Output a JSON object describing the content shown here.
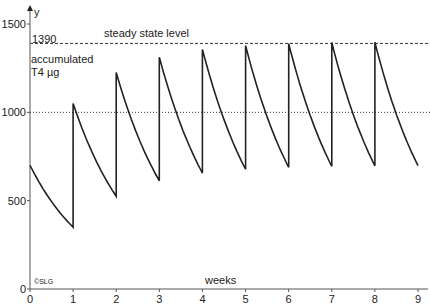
{
  "chart_data": {
    "type": "line",
    "title": "",
    "xlabel": "weeks",
    "ylabel": "y",
    "annotation_ylabel": [
      "accumulated",
      "T4 µg"
    ],
    "xlim": [
      0,
      9
    ],
    "ylim": [
      0,
      1500
    ],
    "x_ticks": [
      "0",
      "1",
      "2",
      "3",
      "4",
      "5",
      "6",
      "7",
      "8",
      "9"
    ],
    "y_ticks": [
      "0",
      "500",
      "1000",
      "1500"
    ],
    "reference_lines": [
      {
        "y": 1390,
        "label": "1390",
        "text": "steady state level",
        "style": "dashed"
      },
      {
        "y": 1000,
        "label": "",
        "text": "",
        "style": "dotted"
      }
    ],
    "copyright": "©SLG",
    "series": [
      {
        "name": "accumulated T4",
        "dose": 700,
        "weekly_decay_factor": 0.5,
        "points": [
          [
            0,
            700
          ],
          [
            1,
            350
          ],
          [
            1,
            1050
          ],
          [
            2,
            525
          ],
          [
            2,
            1225
          ],
          [
            3,
            612
          ],
          [
            3,
            1312
          ],
          [
            4,
            656
          ],
          [
            4,
            1356
          ],
          [
            5,
            678
          ],
          [
            5,
            1378
          ],
          [
            6,
            689
          ],
          [
            6,
            1389
          ],
          [
            7,
            695
          ],
          [
            7,
            1395
          ],
          [
            8,
            697
          ],
          [
            8,
            1397
          ],
          [
            9,
            698
          ]
        ]
      }
    ],
    "grid": false,
    "legend": "none"
  }
}
